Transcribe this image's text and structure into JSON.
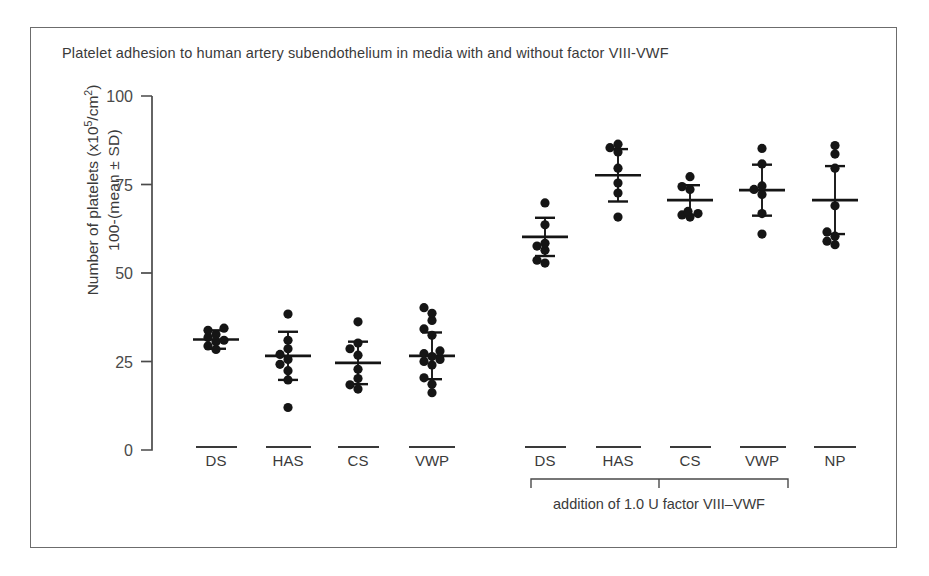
{
  "figure": {
    "title": "Platelet adhesion to human artery subendothelium in media with and without factor VIII-VWF",
    "ylabel_line1_prefix": "Number of platelets (x10",
    "ylabel_line1_sup": "5",
    "ylabel_line1_suffix": "/cm",
    "ylabel_line1_sup2": "2",
    "ylabel_line1_end": ")",
    "ylabel_line2": "100-(mean ± SD)",
    "bracket_caption": "addition of 1.0 U factor VIII–VWF",
    "frame_color": "#6c6c6c",
    "ink_color": "#151515",
    "axis_color": "#4a4a4a"
  },
  "chart_data": {
    "type": "scatter",
    "title": "Platelet adhesion to human artery subendothelium in media with and without factor VIII-VWF",
    "xlabel": "",
    "ylabel": "Number of platelets (x10^5/cm^2) 100-(mean ± SD)",
    "ylim": [
      0,
      100
    ],
    "yticks": [
      0,
      25,
      50,
      75,
      100
    ],
    "ytick_labels": [
      "0",
      "25",
      "50",
      "75",
      "100"
    ],
    "grid": false,
    "legend": "none",
    "categories": [
      "DS",
      "HAS",
      "CS",
      "VWP",
      "DS",
      "HAS",
      "CS",
      "VWP",
      "NP"
    ],
    "groups": [
      {
        "label": "DS",
        "set": "without factor VIII-VWF",
        "mean": 31.2,
        "sd": 2.6,
        "points": [
          28.4,
          29.4,
          30.6,
          31.0,
          31.8,
          32.6,
          33.8,
          34.4
        ]
      },
      {
        "label": "HAS",
        "set": "without factor VIII-VWF",
        "mean": 26.6,
        "sd": 6.8,
        "points": [
          12.0,
          19.8,
          22.4,
          24.2,
          25.6,
          27.0,
          28.6,
          31.0,
          38.4
        ]
      },
      {
        "label": "CS",
        "set": "without factor VIII-VWF",
        "mean": 24.6,
        "sd": 6.0,
        "points": [
          17.2,
          18.4,
          20.2,
          22.8,
          26.8,
          28.6,
          30.2,
          36.2
        ]
      },
      {
        "label": "VWP",
        "set": "without factor VIII-VWF",
        "mean": 26.6,
        "sd": 6.6,
        "points": [
          16.2,
          18.6,
          20.4,
          24.0,
          25.0,
          25.6,
          26.4,
          27.2,
          28.0,
          32.4,
          34.2,
          36.6,
          38.6,
          40.2
        ]
      },
      {
        "label": "DS",
        "set": "addition of 1.0 U factor VIII-VWF",
        "mean": 60.2,
        "sd": 5.4,
        "points": [
          52.8,
          53.6,
          56.4,
          57.6,
          58.4,
          63.6,
          69.8
        ]
      },
      {
        "label": "HAS",
        "set": "addition of 1.0 U factor VIII-VWF",
        "mean": 77.6,
        "sd": 7.4,
        "points": [
          65.8,
          72.6,
          75.4,
          79.6,
          84.2,
          85.4,
          86.4
        ]
      },
      {
        "label": "CS",
        "set": "addition of 1.0 U factor VIII-VWF",
        "mean": 70.6,
        "sd": 4.2,
        "points": [
          65.8,
          66.4,
          66.8,
          67.4,
          73.6,
          74.4,
          77.2
        ]
      },
      {
        "label": "VWP",
        "set": "addition of 1.0 U factor VIII-VWF",
        "mean": 73.4,
        "sd": 7.2,
        "points": [
          61.0,
          66.8,
          72.2,
          73.6,
          74.6,
          80.8,
          85.2
        ]
      },
      {
        "label": "NP",
        "set": "no addition",
        "mean": 70.6,
        "sd": 9.6,
        "points": [
          58.0,
          59.0,
          60.4,
          61.6,
          69.0,
          79.6,
          83.6,
          86.0
        ]
      }
    ]
  },
  "axis": {
    "tick0": "0",
    "tick25": "25",
    "tick50": "50",
    "tick75": "75",
    "tick100": "100"
  },
  "xlabels": {
    "g1": "DS",
    "g2": "HAS",
    "g3": "CS",
    "g4": "VWP",
    "g5": "DS",
    "g6": "HAS",
    "g7": "CS",
    "g8": "VWP",
    "g9": "NP"
  }
}
